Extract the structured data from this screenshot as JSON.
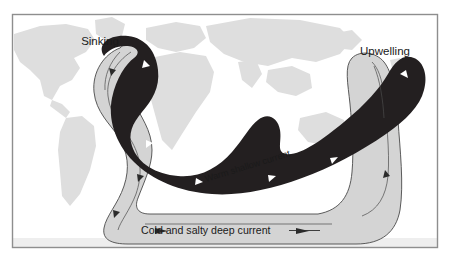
{
  "figure": {
    "frame": {
      "border_color": "#8e8e8e",
      "background_color": "#ffffff"
    },
    "palette": {
      "warm_current_color": "#231f20",
      "cold_current_color": "#d4d4d4",
      "cold_current_outline": "#3a3a3a",
      "continent_color": "#dcdcdc",
      "label_color": "#1a1a1a",
      "arrow_color_on_dark": "#ffffff",
      "arrow_color_on_light": "#2b2b2b"
    },
    "labels": {
      "sinking": "Sinking",
      "upwelling": "Upwelling",
      "warm_shallow_current": "Warm shallow current",
      "cold_salty_deep_current": "Cold and salty deep current"
    },
    "legend_sizes": {
      "sinking_font_px": 11,
      "upwelling_font_px": 11,
      "warm_font_px": 9,
      "cold_font_px": 10.5
    },
    "annotations": {
      "warm_label_rotation_deg": -17,
      "cold_label_rule_visible": true
    }
  },
  "map": {
    "projection": "world-rectangular",
    "continents": [
      "north-america",
      "south-america",
      "greenland",
      "europe",
      "africa",
      "asia",
      "australia",
      "antarctica-edge"
    ]
  },
  "currents": [
    {
      "id": "warm-shallow",
      "name": "Warm shallow current",
      "type": "surface",
      "color": "#231f20",
      "direction": "eastward-to-north-atlantic",
      "arrow_count": 6
    },
    {
      "id": "cold-deep",
      "name": "Cold and salty deep current",
      "type": "deep",
      "color": "#d4d4d4",
      "direction": "southward-then-eastward",
      "arrow_count": 7
    }
  ],
  "process_points": [
    {
      "id": "sinking",
      "label": "Sinking",
      "region": "north-atlantic"
    },
    {
      "id": "upwelling",
      "label": "Upwelling",
      "region": "north-pacific"
    }
  ]
}
